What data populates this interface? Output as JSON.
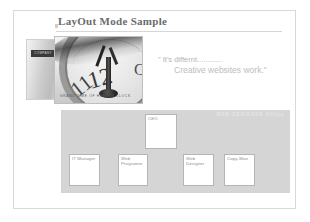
{
  "slide": {
    "title": "LayOut Mode Sample"
  },
  "photo": {
    "binder_spine_text": "COMPANY",
    "caption": "GRAND TIME OF HEAVEN CLOCK"
  },
  "quote": {
    "line1": "\" It's differnt............",
    "line2": "Creative websites work.\""
  },
  "org_chart": {
    "panel_label": "WEB-DESIGNER Office",
    "nodes": [
      {
        "name": "ceo",
        "label": "CEO"
      },
      {
        "name": "it-manager",
        "label": "IT Manager"
      },
      {
        "name": "web-programmer",
        "label": "Web\nProgramer"
      },
      {
        "name": "web-designer",
        "label": "Web\nDesigner"
      },
      {
        "name": "copy-man",
        "label": "Copy-Man"
      }
    ]
  }
}
